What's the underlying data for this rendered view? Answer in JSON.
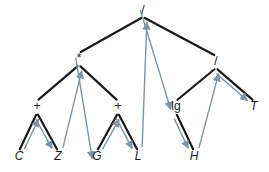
{
  "diagram": {
    "type": "expression-tree",
    "colors": {
      "edge": "#1a1a1a",
      "traversal": "#7f95a6",
      "background": "#ffffff"
    },
    "nodes": [
      {
        "id": "root",
        "label": "/",
        "x": 143,
        "y": 14,
        "kind": "op"
      },
      {
        "id": "mul",
        "label": "*",
        "x": 79,
        "y": 62,
        "kind": "op"
      },
      {
        "id": "div2",
        "label": "/",
        "x": 216,
        "y": 65,
        "kind": "op"
      },
      {
        "id": "plus1",
        "label": "+",
        "x": 37,
        "y": 110,
        "kind": "op"
      },
      {
        "id": "plus2",
        "label": "+",
        "x": 118,
        "y": 110,
        "kind": "op"
      },
      {
        "id": "lg",
        "label": "lg",
        "x": 176,
        "y": 110,
        "kind": "op"
      },
      {
        "id": "T",
        "label": "T",
        "x": 254,
        "y": 110,
        "kind": "leaf"
      },
      {
        "id": "C",
        "label": "C",
        "x": 19,
        "y": 160,
        "kind": "leaf"
      },
      {
        "id": "Z",
        "label": "Z",
        "x": 58,
        "y": 160,
        "kind": "leaf"
      },
      {
        "id": "G",
        "label": "G",
        "x": 97,
        "y": 160,
        "kind": "leaf"
      },
      {
        "id": "L",
        "label": "L",
        "x": 138,
        "y": 160,
        "kind": "leaf"
      },
      {
        "id": "H",
        "label": "H",
        "x": 194,
        "y": 160,
        "kind": "leaf"
      }
    ],
    "edges": [
      [
        "root",
        "mul"
      ],
      [
        "root",
        "div2"
      ],
      [
        "mul",
        "plus1"
      ],
      [
        "mul",
        "plus2"
      ],
      [
        "plus1",
        "C"
      ],
      [
        "plus1",
        "Z"
      ],
      [
        "plus2",
        "G"
      ],
      [
        "plus2",
        "L"
      ],
      [
        "div2",
        "lg"
      ],
      [
        "div2",
        "T"
      ],
      [
        "lg",
        "H"
      ]
    ],
    "traversal": [
      "C",
      "plus1",
      "Z",
      "mul",
      "G",
      "plus2",
      "L",
      "root",
      "lg",
      "H",
      "div2",
      "T"
    ]
  }
}
